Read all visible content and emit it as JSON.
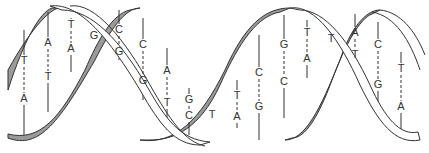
{
  "diagram": {
    "colors": {
      "strand_fill": "#ffffff",
      "groove_fill": "#9a9a9a",
      "stroke": "#333333",
      "text": "#333333"
    },
    "base_pairs": [
      {
        "x": 24,
        "top": "T",
        "top_y": 64,
        "bottom": "A",
        "bottom_y": 102,
        "y1": 30,
        "y2": 135
      },
      {
        "x": 48,
        "top": "A",
        "top_y": 46,
        "bottom": "T",
        "bottom_y": 80,
        "y1": 12,
        "y2": 112
      },
      {
        "x": 71,
        "top": "T",
        "top_y": 28,
        "bottom": "A",
        "bottom_y": 52,
        "y1": 18,
        "y2": 72
      },
      {
        "x": 119,
        "top": "C",
        "top_y": 33,
        "bottom": "G",
        "bottom_y": 55,
        "y1": 10,
        "y2": 60
      },
      {
        "x": 143,
        "top": "C",
        "top_y": 48,
        "bottom": "G",
        "bottom_y": 84,
        "y1": 18,
        "y2": 100
      },
      {
        "x": 167,
        "top": "A",
        "top_y": 74,
        "bottom": "T",
        "bottom_y": 106,
        "y1": 48,
        "y2": 130
      },
      {
        "x": 189,
        "top": "G",
        "top_y": 103,
        "bottom": "C",
        "bottom_y": 119,
        "y1": 88,
        "y2": 135
      },
      {
        "x": 237,
        "top": "T",
        "top_y": 99,
        "bottom": "A",
        "bottom_y": 120,
        "y1": 80,
        "y2": 128
      },
      {
        "x": 259,
        "top": "C",
        "top_y": 76,
        "bottom": "G",
        "bottom_y": 110,
        "y1": 35,
        "y2": 140
      },
      {
        "x": 284,
        "top": "G",
        "top_y": 48,
        "bottom": "C",
        "bottom_y": 85,
        "y1": 15,
        "y2": 118
      },
      {
        "x": 307,
        "top": "T",
        "top_y": 36,
        "bottom": "A",
        "bottom_y": 62,
        "y1": 20,
        "y2": 78
      },
      {
        "x": 355,
        "top": "A",
        "top_y": 36,
        "bottom": "T",
        "bottom_y": 58,
        "y1": 14,
        "y2": 68
      },
      {
        "x": 378,
        "top": "C",
        "top_y": 48,
        "bottom": "G",
        "bottom_y": 88,
        "y1": 22,
        "y2": 104
      },
      {
        "x": 401,
        "top": "T",
        "top_y": 72,
        "bottom": "A",
        "bottom_y": 110,
        "y1": 52,
        "y2": 130
      }
    ],
    "crossover_labels": [
      {
        "x": 94,
        "y": 39,
        "text": "G"
      },
      {
        "x": 212,
        "y": 118,
        "text": "T"
      },
      {
        "x": 331,
        "y": 42,
        "text": "T"
      }
    ]
  }
}
